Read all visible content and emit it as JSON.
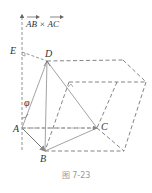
{
  "figure": {
    "caption": "图 7-23",
    "vector_label": "AB × AC",
    "angle_label": "φ",
    "points": {
      "E": {
        "label": "E",
        "x": 18,
        "y": 51
      },
      "D": {
        "label": "D",
        "x": 47,
        "y": 61
      },
      "A": {
        "label": "A",
        "x": 22,
        "y": 128
      },
      "B": {
        "label": "B",
        "x": 45,
        "y": 151
      },
      "C": {
        "label": "C",
        "x": 97,
        "y": 128
      }
    },
    "colors": {
      "solid_line": "#888888",
      "dashed_line": "#666666",
      "text": "#333333",
      "caption": "#999999"
    }
  }
}
